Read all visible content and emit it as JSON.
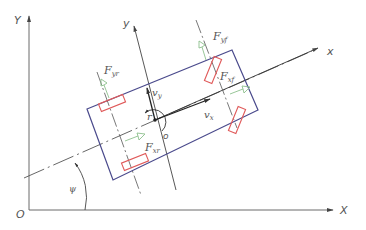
{
  "figure": {
    "type": "vehicle planar dynamics diagram",
    "colors": {
      "axis": "#6b6b6b",
      "body_frame_axis": "#333333",
      "vehicle_outline": "#4a4a8c",
      "wheel": "#e05a5a",
      "force_arrow": "#8cc08c",
      "centerline": "#555555"
    },
    "global_axes": {
      "origin_label": "O",
      "x_label": "X",
      "y_label": "Y"
    },
    "body_axes": {
      "x_label": "x",
      "y_label": "y",
      "origin_label": "o"
    },
    "velocities": {
      "vx_label": "v",
      "vx_sub": "x",
      "vy_label": "v",
      "vy_sub": "y",
      "yaw_rate_label": "r"
    },
    "angle": {
      "heading_label": "ψ"
    },
    "forces": [
      {
        "id": "Fyf",
        "label": "F",
        "sub": "yf",
        "description": "front lateral tire force"
      },
      {
        "id": "Fxf",
        "label": "F",
        "sub": "xf",
        "description": "front longitudinal tire force"
      },
      {
        "id": "Fyr",
        "label": "F",
        "sub": "yr",
        "description": "rear lateral tire force"
      },
      {
        "id": "Fxr",
        "label": "F",
        "sub": "xr",
        "description": "rear longitudinal tire force"
      }
    ]
  }
}
